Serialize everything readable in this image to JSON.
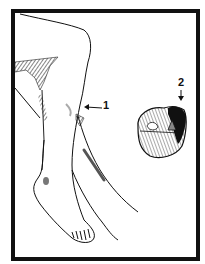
{
  "figure": {
    "type": "medical-illustration",
    "labels": [
      {
        "id": "1",
        "text": "1",
        "pointer": "arrow-left",
        "target": "posterior calf bulge below knee"
      },
      {
        "id": "2",
        "text": "2",
        "pointer": "arrow-down",
        "target": "dark compartment in cross-section"
      }
    ],
    "colors": {
      "border": "#111111",
      "line": "#111111",
      "background": "#ffffff",
      "shading": "#555555"
    }
  }
}
